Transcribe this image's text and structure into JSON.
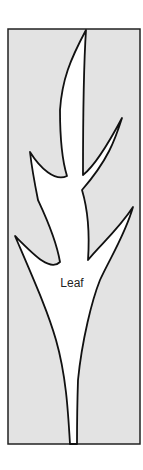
{
  "diagram": {
    "label": "Leaf",
    "colors": {
      "background": "#e3e3e3",
      "leaf_fill": "#ffffff",
      "stroke": "#111111"
    }
  }
}
